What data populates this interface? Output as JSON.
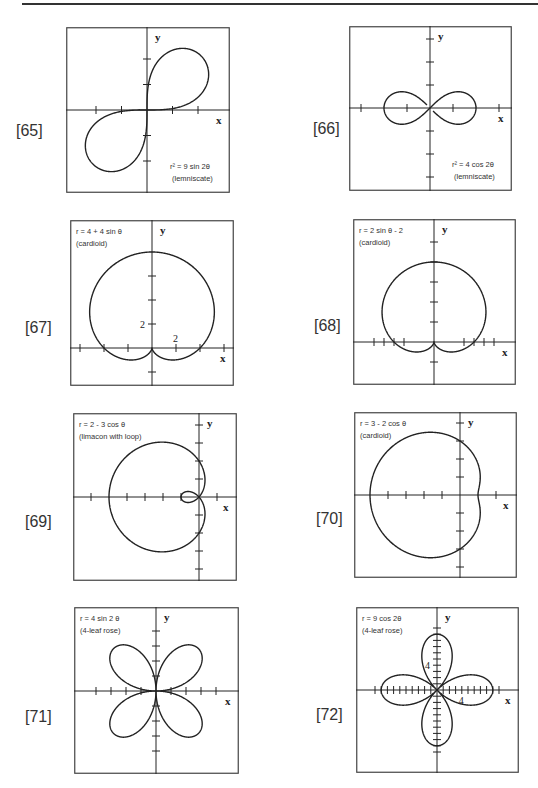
{
  "page": {
    "header_fragment": "Graphing in Polar Coordinates"
  },
  "chart_data": [
    {
      "id": "65",
      "label": "[65]",
      "type": "line",
      "title": "r² = 9 sin 2θ",
      "subtitle": "(lemniscate)",
      "equation": "r^2 = 9 sin(2t)",
      "xlabel": "x",
      "ylabel": "y",
      "tick_unit": 1,
      "xlim": [
        -3.2,
        3.2
      ],
      "ylim": [
        -3.2,
        3.2
      ],
      "x_ticks": [
        -2,
        -1,
        1,
        2
      ],
      "y_ticks": [
        -2,
        -1,
        1,
        2
      ],
      "grid": false,
      "legend_position": "bottom-right"
    },
    {
      "id": "66",
      "label": "[66]",
      "type": "line",
      "title": "r² = 4 cos 2θ",
      "subtitle": "(lemniscate)",
      "equation": "r^2 = 4 cos(2t)",
      "xlabel": "x",
      "ylabel": "y",
      "tick_unit": 1,
      "xlim": [
        -3.5,
        3.5
      ],
      "ylim": [
        -3.5,
        3.5
      ],
      "x_ticks": [
        -3,
        -1,
        1,
        3
      ],
      "y_ticks": [
        -3,
        -2,
        -1,
        1,
        2,
        3
      ],
      "grid": false,
      "legend_position": "bottom-right"
    },
    {
      "id": "67",
      "label": "[67]",
      "type": "line",
      "title": "r = 4 + 4 sin θ",
      "subtitle": "(cardioid)",
      "equation": "r = 4 + 4 sin(t)",
      "xlabel": "x",
      "ylabel": "y",
      "tick_unit": 2,
      "tick_labels": [
        {
          "axis": "y",
          "value": 2,
          "text": "2"
        },
        {
          "axis": "x",
          "value": 2,
          "text": "2"
        }
      ],
      "xlim": [
        -6.5,
        6.5
      ],
      "ylim": [
        -3,
        10
      ],
      "x_ticks": [
        -6,
        -4,
        -2,
        2,
        4,
        6
      ],
      "y_ticks": [
        -2,
        2,
        4,
        6
      ],
      "grid": false,
      "legend_position": "top-left"
    },
    {
      "id": "68",
      "label": "[68]",
      "type": "line",
      "title": "r = 2 sin θ - 2",
      "subtitle": "(cardioid)",
      "equation": "r = 2 sin(t) - 2",
      "xlabel": "x",
      "ylabel": "y",
      "tick_unit": 0.5,
      "xlim": [
        -4,
        4
      ],
      "ylim": [
        -2,
        6
      ],
      "x_ticks": [
        -3,
        -2.5,
        -2,
        -1.5,
        1.5,
        2,
        2.5,
        3
      ],
      "y_ticks": [
        -1,
        1,
        2,
        3,
        4,
        5
      ],
      "grid": false,
      "legend_position": "top-left"
    },
    {
      "id": "69",
      "label": "[69]",
      "type": "line",
      "title": "r = 2 - 3 cos θ",
      "subtitle": "(limacon with loop)",
      "equation": "r = 2 - 3 cos(t)",
      "xlabel": "x",
      "ylabel": "y",
      "tick_unit": 1,
      "xlim": [
        -7,
        2
      ],
      "ylim": [
        -4.5,
        4.5
      ],
      "x_ticks": [
        -6,
        -4,
        -3,
        -2,
        -1,
        1
      ],
      "y_ticks": [
        -4,
        -3,
        -2,
        -1,
        1,
        2,
        3,
        4
      ],
      "grid": false,
      "legend_position": "top-left"
    },
    {
      "id": "70",
      "label": "[70]",
      "type": "line",
      "title": "r = 3 - 2 cos θ",
      "subtitle": "(cardioid)",
      "equation": "r = 3 - 2 cos(t)",
      "xlabel": "x",
      "ylabel": "y",
      "tick_unit": 1,
      "xlim": [
        -6,
        3
      ],
      "ylim": [
        -4.5,
        4.5
      ],
      "x_ticks": [
        -4,
        -3,
        -2,
        -1,
        2
      ],
      "y_ticks": [
        -4,
        -3,
        -2,
        -1,
        1,
        2,
        3,
        4
      ],
      "grid": false,
      "legend_position": "top-left"
    },
    {
      "id": "71",
      "label": "[71]",
      "type": "line",
      "title": "r = 4 sin 2 θ",
      "subtitle": "(4-leaf rose)",
      "equation": "r = 4 sin(2t)",
      "xlabel": "x",
      "ylabel": "y",
      "tick_unit": 1,
      "xlim": [
        -5.5,
        5.5
      ],
      "ylim": [
        -5.5,
        5.5
      ],
      "x_ticks": [
        -4,
        -3,
        -2,
        -1,
        1,
        2,
        3,
        4
      ],
      "y_ticks": [
        -4,
        -3,
        -2,
        -1,
        1,
        2,
        3,
        4
      ],
      "grid": false,
      "legend_position": "top-left"
    },
    {
      "id": "72",
      "label": "[72]",
      "type": "line",
      "title": "r = 9 cos 2θ",
      "subtitle": "(4-leaf rose)",
      "equation": "r = 9 cos(2t)",
      "xlabel": "x",
      "ylabel": "y",
      "tick_unit": 1,
      "tick_labels": [
        {
          "axis": "y",
          "value": 4,
          "text": "4"
        },
        {
          "axis": "x",
          "value": 4,
          "text": "4"
        }
      ],
      "xlim": [
        -13,
        13
      ],
      "ylim": [
        -13,
        13
      ],
      "x_ticks": [
        -10,
        -9,
        -8,
        -7,
        -6,
        -5,
        -4,
        -3,
        -2,
        -1,
        1,
        2,
        3,
        4,
        5,
        6,
        7,
        8,
        9,
        10
      ],
      "y_ticks": [
        -10,
        -9,
        -8,
        -7,
        -6,
        -5,
        -4,
        -3,
        -2,
        -1,
        1,
        2,
        3,
        4,
        5,
        6,
        7,
        8,
        9,
        10
      ],
      "grid": false,
      "legend_position": "top-left"
    }
  ],
  "colors": {
    "ink": "#222222",
    "label": "#333333",
    "background": "#ffffff"
  }
}
